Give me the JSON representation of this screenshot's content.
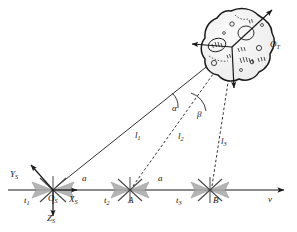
{
  "figure": {
    "type": "geometry-diagram",
    "background_color": "#ffffff",
    "line_color": "#1a1a1a",
    "panel_fill": "#a8a8a8"
  },
  "labels": {
    "target_object": "O",
    "target_object_sub": "T",
    "origin": "O",
    "origin_sub": "S",
    "axis_x": "X",
    "axis_x_sub": "S",
    "axis_y": "Y",
    "axis_y_sub": "S",
    "axis_z": "Z",
    "axis_z_sub": "S",
    "time_1": "t",
    "time_1_sub": "1",
    "time_2": "t",
    "time_2_sub": "2",
    "time_3": "t",
    "time_3_sub": "3",
    "station_a": "A",
    "station_b": "B",
    "range_1": "l",
    "range_1_sub": "1",
    "range_2": "l",
    "range_2_sub": "2",
    "range_3": "l",
    "range_3_sub": "3",
    "baseline_1": "a",
    "baseline_2": "a",
    "angle_alpha": "α",
    "angle_beta": "β",
    "velocity": "v"
  },
  "geometry": {
    "target_center": [
      232,
      47
    ],
    "observer_positions": [
      [
        53,
        190
      ],
      [
        130,
        190
      ],
      [
        210,
        190
      ]
    ],
    "baseline_y": 190,
    "baseline_x_start": 8,
    "baseline_x_end": 288,
    "segment_length_label": "a"
  }
}
